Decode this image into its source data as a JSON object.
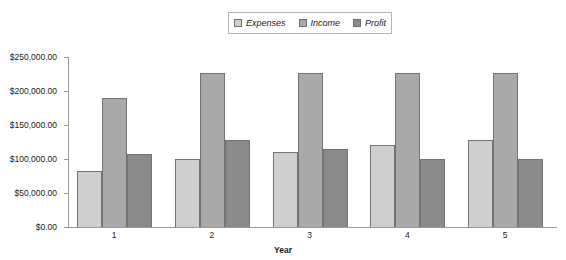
{
  "chart_data": {
    "type": "bar",
    "title": "",
    "subtitle": "",
    "xlabel": "Year",
    "ylabel": "",
    "categories": [
      "1",
      "2",
      "3",
      "4",
      "5"
    ],
    "series": [
      {
        "name": "Expenses",
        "color": "#cfcfcf",
        "values": [
          83000,
          100000,
          110000,
          120000,
          128000
        ]
      },
      {
        "name": "Income",
        "color": "#a9a9a9",
        "values": [
          190000,
          227000,
          227000,
          227000,
          227000
        ]
      },
      {
        "name": "Profit",
        "color": "#8b8b8b",
        "values": [
          107000,
          128000,
          115000,
          100000,
          100000
        ]
      }
    ],
    "ylim": [
      0,
      250000
    ],
    "ytick_values": [
      0,
      50000,
      100000,
      150000,
      200000,
      250000
    ],
    "ytick_labels": [
      "$0.00",
      "$50,000.00",
      "$100,000.00",
      "$150,000.00",
      "$200,000.00",
      "$250,000.00"
    ],
    "xtick_labels": [
      "1",
      "2",
      "3",
      "4",
      "5"
    ],
    "grid": false,
    "legend_position": "top-center",
    "legend_entries": [
      "Expenses",
      "Income",
      "Profit"
    ],
    "annotations": []
  },
  "legend": {
    "items": [
      {
        "label": "Expenses",
        "swatch": "#cfcfcf"
      },
      {
        "label": "Income",
        "swatch": "#a9a9a9"
      },
      {
        "label": "Profit",
        "swatch": "#8b8b8b"
      }
    ]
  },
  "axes": {
    "x_title": "Year",
    "y_labels": [
      "$250,000.00",
      "$200,000.00",
      "$150,000.00",
      "$100,000.00",
      "$50,000.00",
      "$0.00"
    ],
    "x_labels": [
      "1",
      "2",
      "3",
      "4",
      "5"
    ]
  }
}
